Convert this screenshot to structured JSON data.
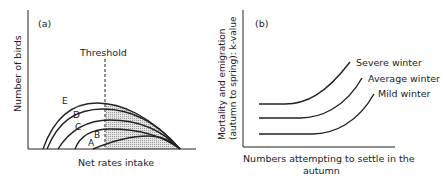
{
  "panel_a": {
    "label": "(a)",
    "ylabel": "Number of birds",
    "xlabel": "Net rates intake",
    "threshold_label": "Threshold",
    "curve_labels": [
      "A",
      "B",
      "C",
      "D",
      "E"
    ]
  },
  "panel_b": {
    "label": "(b)",
    "ylabel_line1": "Mortality and emigration",
    "ylabel_line2": "(autumn to spring): k-value",
    "xlabel_line1": "Numbers attempting to settle in the",
    "xlabel_line2": "autumn",
    "curve_labels": [
      "Severe winter",
      "Average winter",
      "Mild winter"
    ]
  },
  "colors": {
    "line": "#222222",
    "shade": "#cfcfcf"
  }
}
